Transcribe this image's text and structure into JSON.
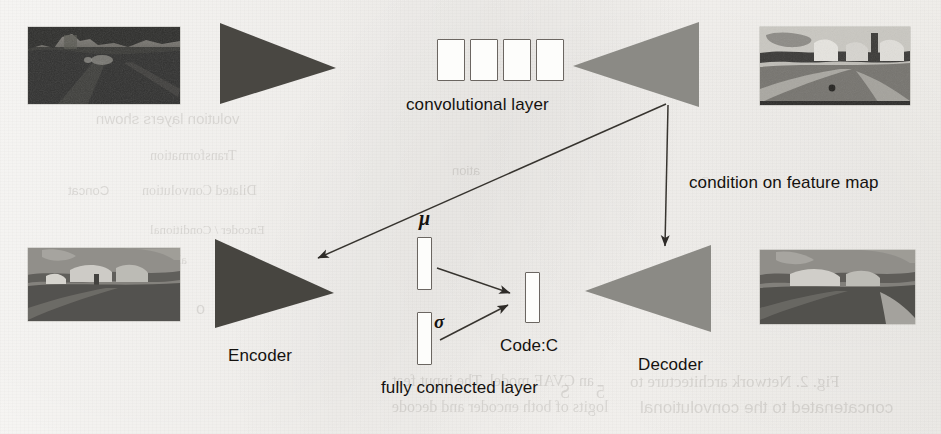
{
  "figure": {
    "type": "diagram",
    "labels": {
      "convolutional_layer": "convolutional layer",
      "condition_on_feature_map": "condition on feature map",
      "encoder": "Encoder",
      "decoder": "Decoder",
      "fully_connected_layer": "fully connected layer",
      "code": "Code:C",
      "mu": "μ",
      "sigma": "σ"
    },
    "colors": {
      "paper": "#faf8f5",
      "encoder_dark": "#4a4843",
      "decoder_gray": "#8b8a85",
      "stroke": "#3a3733",
      "text": "#15120f"
    },
    "nodes": [
      {
        "name": "input-photo",
        "kind": "image",
        "caption": ""
      },
      {
        "name": "top-encoder-triangle",
        "kind": "triangle",
        "direction": "right",
        "shade": "dark"
      },
      {
        "name": "convolutional-layer",
        "kind": "feature-maps",
        "count": 4
      },
      {
        "name": "top-decoder-triangle",
        "kind": "triangle",
        "direction": "left",
        "shade": "light"
      },
      {
        "name": "output-segmentation",
        "kind": "image",
        "caption": ""
      },
      {
        "name": "groundtruth-segmentation",
        "kind": "image",
        "caption": ""
      },
      {
        "name": "bottom-encoder-triangle",
        "kind": "triangle",
        "direction": "right",
        "shade": "dark"
      },
      {
        "name": "mu-bar",
        "kind": "vector"
      },
      {
        "name": "sigma-bar",
        "kind": "vector"
      },
      {
        "name": "code-bar",
        "kind": "vector"
      },
      {
        "name": "bottom-decoder-triangle",
        "kind": "triangle",
        "direction": "left",
        "shade": "light"
      },
      {
        "name": "reconstructed-segmentation",
        "kind": "image",
        "caption": ""
      }
    ],
    "edges": [
      {
        "from": "convolutional-layer",
        "to": "bottom-encoder-triangle",
        "label": ""
      },
      {
        "from": "convolutional-layer",
        "to": "bottom-decoder-triangle",
        "label": "condition on feature map"
      },
      {
        "from": "mu-bar",
        "to": "code-bar",
        "label": ""
      },
      {
        "from": "sigma-bar",
        "to": "code-bar",
        "label": ""
      }
    ]
  },
  "bleed_through": {
    "note": "faint mirrored text showing through from the reverse side of the scanned page",
    "lines": [
      {
        "text": "volution layers shown",
        "x": 96,
        "y": 110,
        "size": 15
      },
      {
        "text": "Transformation",
        "x": 150,
        "y": 148,
        "size": 14
      },
      {
        "text": "Dilated Convolution",
        "x": 142,
        "y": 183,
        "size": 14
      },
      {
        "text": "Concat",
        "x": 68,
        "y": 183,
        "size": 13
      },
      {
        "text": "Encoder / Conditional",
        "x": 150,
        "y": 222,
        "size": 13
      },
      {
        "text": "al Ce",
        "x": 160,
        "y": 252,
        "size": 13
      },
      {
        "text": "ation",
        "x": 452,
        "y": 163,
        "size": 13
      },
      {
        "text": "O",
        "x": 700,
        "y": 175,
        "size": 14
      },
      {
        "text": "Fig. 2. Network architecture  to",
        "x": 630,
        "y": 372,
        "size": 17
      },
      {
        "text": "concatenated to the convolutional",
        "x": 640,
        "y": 398,
        "size": 17
      },
      {
        "text": "an  CVAE model.  The  input  feat",
        "x": 392,
        "y": 372,
        "size": 16
      },
      {
        "text": "logits  of  both  encoder and decode",
        "x": 392,
        "y": 398,
        "size": 16
      },
      {
        "text": "o",
        "x": 196,
        "y": 300,
        "size": 16
      },
      {
        "text": "S",
        "x": 560,
        "y": 382,
        "size": 18
      },
      {
        "text": "5",
        "x": 596,
        "y": 382,
        "size": 18
      }
    ]
  }
}
